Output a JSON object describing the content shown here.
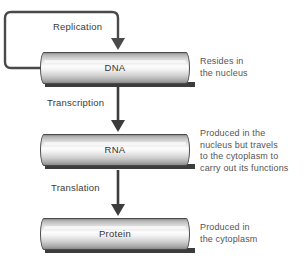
{
  "diagram": {
    "type": "flow-diagram",
    "background_color": "#ffffff",
    "text_color": "#3a3a3a",
    "annotation_color": "#555555",
    "outline_color": "#4a4a4a"
  },
  "nodes": [
    {
      "id": "dna",
      "label": "DNA"
    },
    {
      "id": "rna",
      "label": "RNA"
    },
    {
      "id": "protein",
      "label": "Protein"
    }
  ],
  "processes": [
    {
      "id": "replication",
      "label": "Replication",
      "from": "dna",
      "to": "dna"
    },
    {
      "id": "transcription",
      "label": "Transcription",
      "from": "dna",
      "to": "rna"
    },
    {
      "id": "translation",
      "label": "Translation",
      "from": "rna",
      "to": "protein"
    }
  ],
  "annotations": {
    "dna": {
      "lines": [
        "Resides in",
        "the nucleus"
      ]
    },
    "rna": {
      "lines": [
        "Produced in the",
        "nucleus but travels",
        "to the cytoplasm to",
        "carry out its functions"
      ]
    },
    "protein": {
      "lines": [
        "Produced in",
        "the cytoplasm"
      ]
    }
  }
}
